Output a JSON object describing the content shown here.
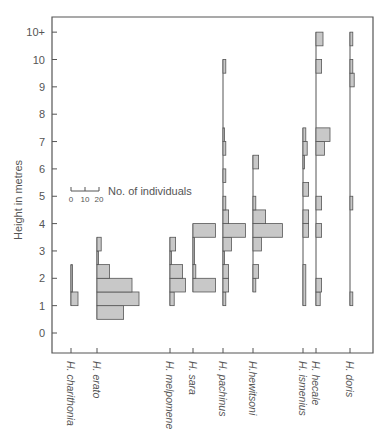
{
  "chart_data": {
    "type": "bar",
    "subtype": "kite-diagram / horizontal histograms per species",
    "title": "",
    "ylabel": "Height in metres",
    "xlabel": "",
    "y_ticks": [
      "0",
      "1",
      "2",
      "3",
      "4",
      "5",
      "6",
      "7",
      "8",
      "9",
      "10",
      "10+"
    ],
    "ylim": [
      -0.5,
      10.5
    ],
    "bin_size_m": 0.5,
    "legend": {
      "label": "No. of individuals",
      "scale_ticks": [
        "0",
        "10",
        "20"
      ]
    },
    "colors": {
      "bar_fill": "#c8c8c8",
      "bar_stroke": "#555555",
      "axis": "#555555"
    },
    "species": [
      {
        "name": "H. charithonia",
        "bins": [
          {
            "from": 1.0,
            "to": 1.5,
            "count": 5
          },
          {
            "from": 1.5,
            "to": 2.5,
            "count": 1
          }
        ]
      },
      {
        "name": "H. erato",
        "bins": [
          {
            "from": 0.5,
            "to": 1.0,
            "count": 19
          },
          {
            "from": 1.0,
            "to": 1.5,
            "count": 30
          },
          {
            "from": 1.5,
            "to": 2.0,
            "count": 25
          },
          {
            "from": 2.0,
            "to": 2.5,
            "count": 9
          },
          {
            "from": 2.5,
            "to": 3.0,
            "count": 1
          },
          {
            "from": 3.0,
            "to": 3.5,
            "count": 3
          }
        ]
      },
      {
        "name": "H. melpomene",
        "bins": [
          {
            "from": 1.0,
            "to": 1.5,
            "count": 3
          },
          {
            "from": 1.5,
            "to": 2.0,
            "count": 11
          },
          {
            "from": 2.0,
            "to": 2.5,
            "count": 9
          },
          {
            "from": 2.5,
            "to": 3.0,
            "count": 1
          },
          {
            "from": 3.0,
            "to": 3.5,
            "count": 4
          }
        ]
      },
      {
        "name": "H. sara",
        "bins": [
          {
            "from": 1.5,
            "to": 2.0,
            "count": 16
          },
          {
            "from": 2.0,
            "to": 2.5,
            "count": 2
          },
          {
            "from": 2.5,
            "to": 3.5,
            "count": 1
          },
          {
            "from": 3.5,
            "to": 4.0,
            "count": 16
          }
        ]
      },
      {
        "name": "H. pachinus",
        "bins": [
          {
            "from": 1.0,
            "to": 1.5,
            "count": 2
          },
          {
            "from": 1.5,
            "to": 2.0,
            "count": 4
          },
          {
            "from": 2.0,
            "to": 2.5,
            "count": 4
          },
          {
            "from": 2.5,
            "to": 3.0,
            "count": 1
          },
          {
            "from": 3.0,
            "to": 3.5,
            "count": 6
          },
          {
            "from": 3.5,
            "to": 4.0,
            "count": 16
          },
          {
            "from": 4.0,
            "to": 4.5,
            "count": 4
          },
          {
            "from": 4.5,
            "to": 5.0,
            "count": 2
          },
          {
            "from": 5.5,
            "to": 6.0,
            "count": 2
          },
          {
            "from": 6.5,
            "to": 7.0,
            "count": 2
          },
          {
            "from": 7.0,
            "to": 7.5,
            "count": 1
          },
          {
            "from": 9.5,
            "to": 10.0,
            "count": 2
          }
        ]
      },
      {
        "name": "H.hewitsoni",
        "bins": [
          {
            "from": 1.5,
            "to": 2.0,
            "count": 2
          },
          {
            "from": 2.0,
            "to": 2.5,
            "count": 4
          },
          {
            "from": 3.0,
            "to": 3.5,
            "count": 6
          },
          {
            "from": 3.5,
            "to": 4.0,
            "count": 21
          },
          {
            "from": 4.0,
            "to": 4.5,
            "count": 9
          },
          {
            "from": 4.5,
            "to": 5.0,
            "count": 2
          },
          {
            "from": 6.0,
            "to": 6.5,
            "count": 4
          }
        ]
      },
      {
        "name": "H. ismenius",
        "bins": [
          {
            "from": 1.0,
            "to": 2.5,
            "count": 2
          },
          {
            "from": 3.5,
            "to": 4.0,
            "count": 4
          },
          {
            "from": 4.0,
            "to": 4.5,
            "count": 4
          },
          {
            "from": 5.0,
            "to": 5.5,
            "count": 4
          },
          {
            "from": 6.0,
            "to": 6.5,
            "count": 1
          },
          {
            "from": 6.5,
            "to": 7.0,
            "count": 3
          },
          {
            "from": 7.0,
            "to": 7.5,
            "count": 2
          }
        ]
      },
      {
        "name": "H. hecale",
        "bins": [
          {
            "from": 1.0,
            "to": 1.5,
            "count": 3
          },
          {
            "from": 1.5,
            "to": 2.0,
            "count": 4
          },
          {
            "from": 3.5,
            "to": 4.0,
            "count": 4
          },
          {
            "from": 4.5,
            "to": 5.0,
            "count": 4
          },
          {
            "from": 6.5,
            "to": 7.0,
            "count": 6
          },
          {
            "from": 7.0,
            "to": 7.5,
            "count": 10
          },
          {
            "from": 9.5,
            "to": 10.0,
            "count": 4
          },
          {
            "from": 10.5,
            "to": 11.0,
            "count": 5
          }
        ]
      },
      {
        "name": "H. doris",
        "bins": [
          {
            "from": 1.0,
            "to": 1.5,
            "count": 2
          },
          {
            "from": 4.5,
            "to": 5.0,
            "count": 2
          },
          {
            "from": 9.0,
            "to": 9.5,
            "count": 3
          },
          {
            "from": 9.5,
            "to": 10.0,
            "count": 2
          },
          {
            "from": 10.5,
            "to": 11.0,
            "count": 2
          }
        ]
      }
    ]
  },
  "layout": {
    "species_x": [
      71,
      97,
      170,
      193,
      223,
      253,
      303,
      316,
      350
    ]
  }
}
